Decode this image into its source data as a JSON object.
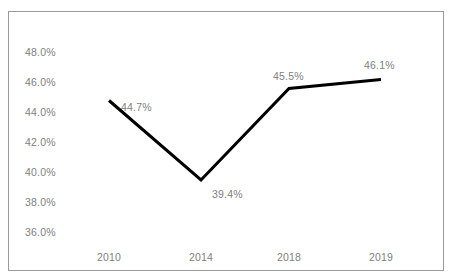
{
  "chart_data": {
    "type": "line",
    "title": "",
    "subtitle": "",
    "xlabel": "",
    "ylabel": "",
    "categories": [
      "2010",
      "2014",
      "2018",
      "2019"
    ],
    "values": [
      44.7,
      39.4,
      45.5,
      46.1
    ],
    "data_labels": [
      "44.7%",
      "39.4%",
      "45.5%",
      "46.1%"
    ],
    "series": [
      {
        "name": "",
        "values": [
          44.7,
          39.4,
          45.5,
          46.1
        ],
        "color": "#000000"
      }
    ],
    "ylim": [
      36.0,
      48.0
    ],
    "ytick_labels": [
      "48.0%",
      "46.0%",
      "44.0%",
      "42.0%",
      "40.0%",
      "38.0%",
      "36.0%"
    ],
    "ytick_values": [
      48.0,
      46.0,
      44.0,
      42.0,
      40.0,
      38.0,
      36.0
    ],
    "grid": false,
    "legend": false,
    "legend_position": "none",
    "annotations": [],
    "colors": {
      "line": "#000000",
      "label_text": "#808080",
      "border": "#9a9a9a",
      "background": "#ffffff"
    }
  }
}
